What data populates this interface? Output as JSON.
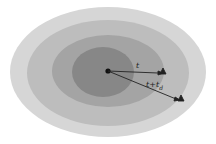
{
  "diagram": {
    "type": "concentric-ellipses",
    "rings": [
      {
        "name": "outer",
        "cx": 108,
        "cy": 72,
        "rx": 98,
        "ry": 65,
        "color": "#d6d6d6"
      },
      {
        "name": "ring-2",
        "cx": 108,
        "cy": 73,
        "rx": 81,
        "ry": 53,
        "color": "#bdbdbd"
      },
      {
        "name": "ring-3",
        "cx": 108,
        "cy": 71,
        "rx": 56,
        "ry": 36,
        "color": "#a4a4a4"
      },
      {
        "name": "inner",
        "cx": 103,
        "cy": 72,
        "rx": 30,
        "ry": 25,
        "color": "#878787"
      }
    ],
    "center": {
      "x": 108,
      "y": 71
    },
    "arrows": [
      {
        "name": "t-arrow",
        "label": "t",
        "to_x": 164,
        "to_y": 72
      },
      {
        "name": "t-plus-td-arrow",
        "label": "t+t₄",
        "to_x": 183,
        "to_y": 100
      }
    ]
  },
  "labels": {
    "t": "t",
    "t_td_main": "t+t",
    "t_td_sub": "d"
  }
}
